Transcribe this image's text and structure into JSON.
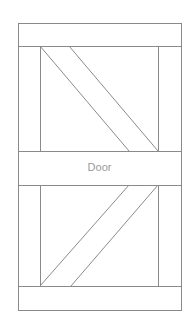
{
  "diagram": {
    "label": "Door",
    "stroke_color": "#8a8a8a",
    "label_color": "#9a9a9a"
  }
}
